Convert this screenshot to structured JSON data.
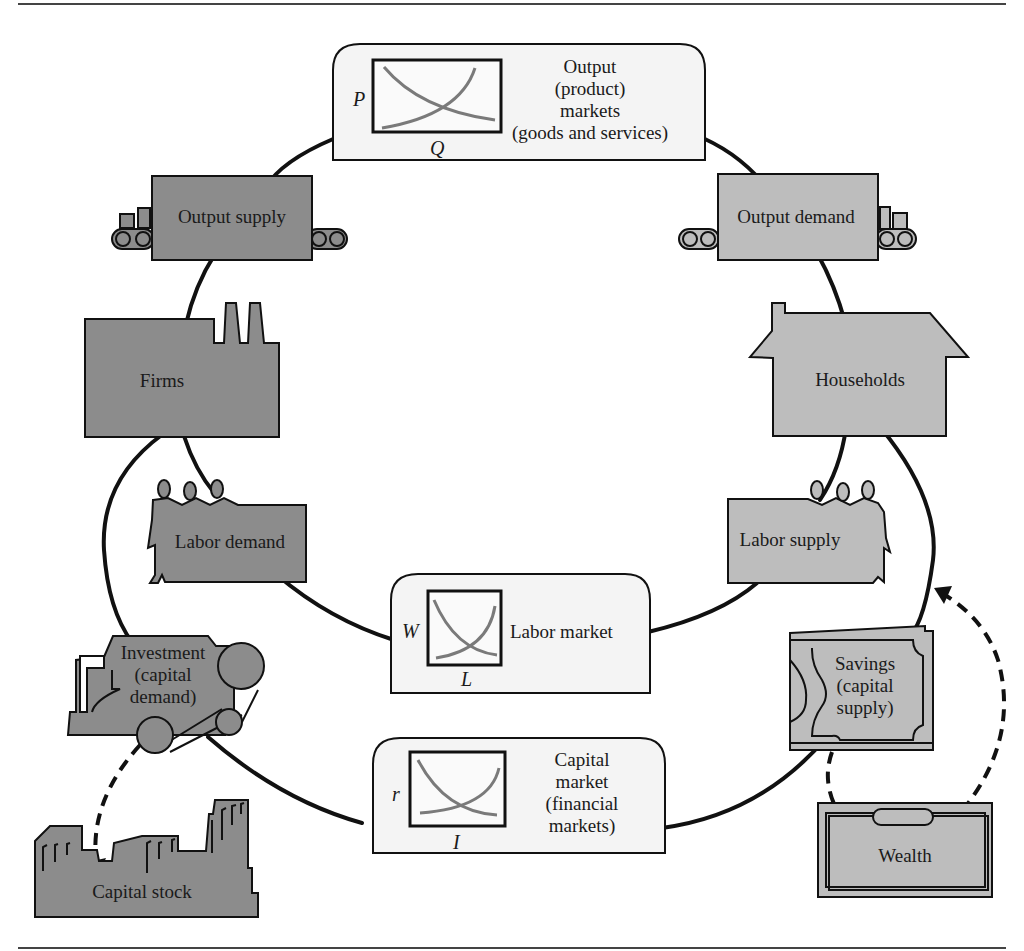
{
  "diagram": {
    "colors": {
      "firm_side_fill": "#8c8c8c",
      "household_side_fill": "#bdbdbd",
      "market_box_fill": "#f4f4f4",
      "stroke": "#111111",
      "curve": "#7a7a7a"
    },
    "markets": {
      "output": {
        "lines": [
          "Output",
          "(product)",
          "markets",
          "(goods and services)"
        ],
        "y_axis": "P",
        "x_axis": "Q"
      },
      "labor": {
        "lines": [
          "Labor market"
        ],
        "y_axis": "W",
        "x_axis": "L"
      },
      "capital": {
        "lines": [
          "Capital",
          "market",
          "(financial",
          "markets)"
        ],
        "y_axis": "r",
        "x_axis": "I"
      }
    },
    "nodes": {
      "output_supply": "Output supply",
      "output_demand": "Output demand",
      "firms": "Firms",
      "households": "Households",
      "labor_demand": "Labor demand",
      "labor_supply": "Labor supply",
      "investment": [
        "Investment",
        "(capital",
        "demand)"
      ],
      "savings": [
        "Savings",
        "(capital",
        "supply)"
      ],
      "capital_stock": "Capital stock",
      "wealth": "Wealth"
    },
    "icons": {
      "output_supply": "conveyor-belt-icon",
      "output_demand": "conveyor-belt-icon",
      "firms": "factory-icon",
      "households": "house-icon",
      "labor_demand": "workers-icon",
      "labor_supply": "workers-icon",
      "investment": "machine-icon",
      "savings": "banknote-icon",
      "capital_stock": "buildings-icon",
      "wealth": "wallet-icon"
    }
  }
}
